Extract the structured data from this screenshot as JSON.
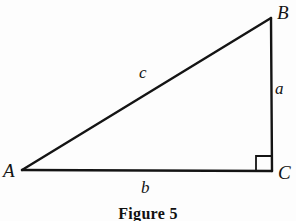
{
  "figure": {
    "caption": "Figure 5",
    "background_color": "#fdfdfd",
    "stroke_color": "#141414",
    "vertices": {
      "a": {
        "label": "A",
        "x": 22,
        "y": 170
      },
      "b": {
        "label": "B",
        "x": 271,
        "y": 18
      },
      "c": {
        "label": "C",
        "x": 272,
        "y": 170
      }
    },
    "sides": {
      "hypotenuse": {
        "label": "c",
        "from": "A",
        "to": "B"
      },
      "vertical": {
        "label": "a",
        "from": "B",
        "to": "C"
      },
      "base": {
        "label": "b",
        "from": "A",
        "to": "C"
      }
    },
    "right_angle": {
      "at_vertex": "C",
      "marker_size": 14,
      "marker_x": 256,
      "marker_y": 156
    }
  }
}
